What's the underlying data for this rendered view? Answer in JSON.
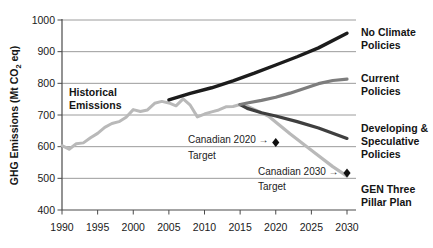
{
  "chart_data": {
    "type": "line",
    "title": "",
    "xlabel": "",
    "ylabel": "GHG Emissions (Mt CO2 eq)",
    "ylabel_parts": {
      "pre": "GHG Emissions (Mt CO",
      "sub": "2",
      "post": " eq)"
    },
    "xlim": [
      1990,
      2030
    ],
    "ylim": [
      400,
      1000
    ],
    "x_ticks": [
      1990,
      1995,
      2000,
      2005,
      2010,
      2015,
      2020,
      2025,
      2030
    ],
    "y_ticks": [
      400,
      500,
      600,
      700,
      800,
      900,
      1000
    ],
    "grid": true,
    "legend_position": "right-of-line-ends",
    "style": {
      "grid_color": "#9c9c9c",
      "axis_color": "#4a4a4a",
      "tick_label_color": "#1a1a1a",
      "marker_color": "#0f0f0f"
    },
    "series": [
      {
        "id": "historical",
        "label": "Historical Emissions",
        "color": "#b9b9b9",
        "width": 3,
        "x": [
          1990,
          1991,
          1992,
          1993,
          1994,
          1995,
          1996,
          1997,
          1998,
          1999,
          2000,
          2001,
          2002,
          2003,
          2004,
          2005,
          2006,
          2007,
          2008,
          2009,
          2010,
          2011,
          2012,
          2013,
          2014,
          2015
        ],
        "values": [
          603,
          592,
          609,
          612,
          628,
          642,
          661,
          673,
          679,
          693,
          717,
          711,
          716,
          737,
          743,
          738,
          729,
          751,
          731,
          694,
          703,
          710,
          716,
          726,
          727,
          733
        ]
      },
      {
        "id": "gen-three-pillar-plan",
        "label": "GEN Three Pillar Plan",
        "color": "#b9b9b9",
        "width": 3.2,
        "x": [
          2015,
          2016,
          2019,
          2022,
          2025,
          2028,
          2030
        ],
        "values": [
          733,
          728,
          696,
          641,
          589,
          537,
          507
        ]
      },
      {
        "id": "developing-speculative-policies",
        "label": "Developing & Speculative Policies",
        "color": "#3f3f3f",
        "width": 3.2,
        "x": [
          2015,
          2016,
          2018,
          2020,
          2023,
          2026,
          2030
        ],
        "values": [
          733,
          721,
          707,
          697,
          679,
          659,
          626
        ]
      },
      {
        "id": "current-policies",
        "label": "Current Policies",
        "color": "#7d7d7d",
        "width": 3.2,
        "x": [
          2015,
          2016,
          2018,
          2020,
          2022,
          2024,
          2026,
          2028,
          2030
        ],
        "values": [
          733,
          738,
          746,
          756,
          769,
          784,
          799,
          809,
          813
        ]
      },
      {
        "id": "no-climate-policies",
        "label": "No Climate Policies",
        "color": "#1c1c1c",
        "width": 3.4,
        "x": [
          2005,
          2008,
          2011,
          2014,
          2017,
          2020,
          2023,
          2026,
          2030
        ],
        "values": [
          748,
          768,
          786,
          808,
          832,
          858,
          884,
          912,
          958
        ]
      }
    ],
    "markers": [
      {
        "id": "canadian-2020-target",
        "shape": "diamond",
        "x": 2020,
        "value": 613
      },
      {
        "id": "canadian-2030-target",
        "shape": "diamond",
        "x": 2030,
        "value": 517
      }
    ],
    "annotations": [
      {
        "id": "canadian-2020-target",
        "line1": "Canadian 2020 →",
        "line2": "Target",
        "x": 2020,
        "value": 613
      },
      {
        "id": "canadian-2030-target",
        "line1": "Canadian 2030 →",
        "line2": "Target",
        "x": 2030,
        "value": 517
      }
    ]
  }
}
